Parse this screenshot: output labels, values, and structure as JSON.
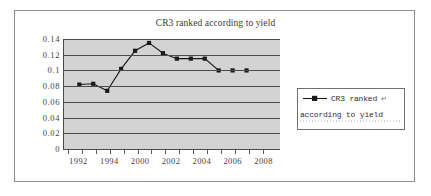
{
  "chart_data": {
    "type": "line",
    "title": "CR3 ranked according to yield",
    "xlabel": "",
    "ylabel": "",
    "ylim": [
      0,
      0.14
    ],
    "yticks": [
      "0.14",
      "0.12",
      "0.1",
      "0.08",
      "0.06",
      "0.04",
      "0.02",
      "0"
    ],
    "ytick_values": [
      0.14,
      0.12,
      0.1,
      0.08,
      0.06,
      0.04,
      0.02,
      0
    ],
    "xtick_labels": [
      "1992",
      "1994",
      "2000",
      "2002",
      "2004",
      "2006",
      "2008"
    ],
    "grid": true,
    "legend_position": "right",
    "series": [
      {
        "name": "CR3 ranked according to yield",
        "marker": "square",
        "color": "#1a1a1a",
        "x": [
          1993,
          1994,
          1996,
          1999,
          2001,
          2002,
          2003,
          2004,
          2005,
          2006,
          2007,
          2008,
          2009
        ],
        "values": [
          0.082,
          0.083,
          0.074,
          0.102,
          0.125,
          0.135,
          0.122,
          0.115,
          0.115,
          0.115,
          0.1,
          0.1,
          0.1
        ]
      }
    ],
    "legend_entries": [
      {
        "line1": "CR3 ranked",
        "line2": "according to yield",
        "artifact1": "↵",
        "artifact2": "↵"
      }
    ]
  },
  "colors": {
    "plot_background": "#d3d3d3",
    "gridline": "#4d4d4d",
    "series": "#1a1a1a",
    "frame": "#8f8f8f",
    "text": "#3f3f3f"
  }
}
